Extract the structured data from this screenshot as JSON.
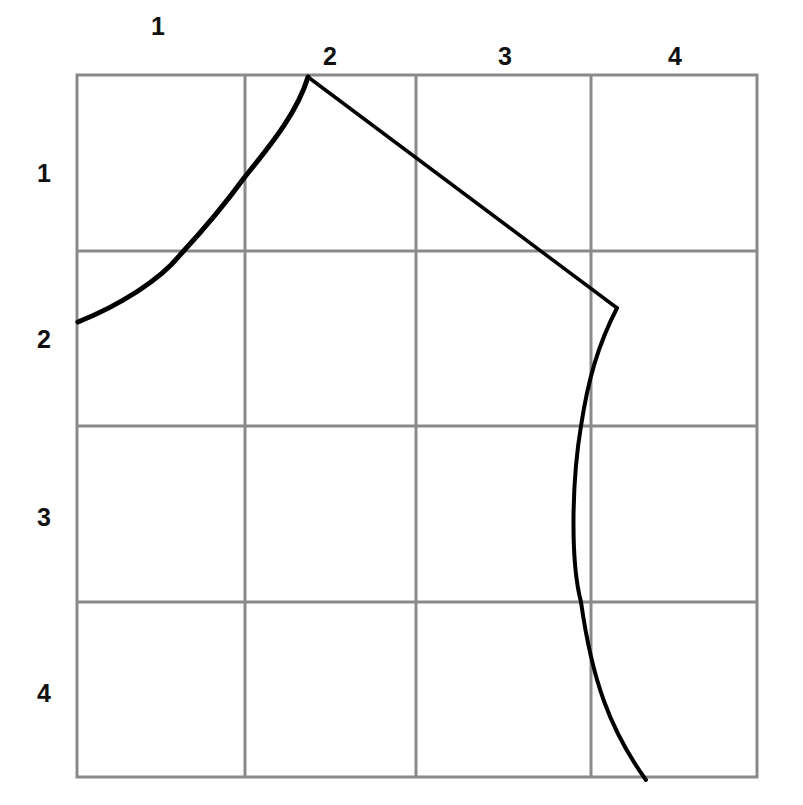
{
  "grid": {
    "rows": 4,
    "cols": 4,
    "line_color": "#8a8a8a",
    "x_lines": [
      77,
      245,
      416,
      591,
      757
    ],
    "y_lines": [
      75,
      251,
      426,
      602,
      777
    ]
  },
  "labels": {
    "columns": [
      {
        "text": "1",
        "x": 158,
        "y": 35
      },
      {
        "text": "2",
        "x": 330,
        "y": 65
      },
      {
        "text": "3",
        "x": 505,
        "y": 65
      },
      {
        "text": "4",
        "x": 675,
        "y": 65
      }
    ],
    "rows": [
      {
        "text": "1",
        "x": 44,
        "y": 182
      },
      {
        "text": "2",
        "x": 44,
        "y": 348
      },
      {
        "text": "3",
        "x": 44,
        "y": 526
      },
      {
        "text": "4",
        "x": 44,
        "y": 702
      }
    ]
  },
  "shape": {
    "stroke_color": "#000000",
    "description": "Pattern outline drawn on a 4x4 grid (e.g. bodice/armhole draft)",
    "points": {
      "left_start": [
        78,
        322
      ],
      "apex": [
        308,
        77
      ],
      "right_vertex": [
        617,
        308
      ],
      "bottom_end": [
        646,
        780
      ]
    }
  }
}
